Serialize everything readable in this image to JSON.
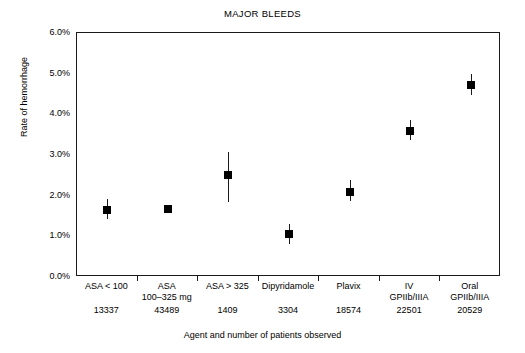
{
  "chart_data": {
    "type": "scatter",
    "title": "MAJOR BLEEDS",
    "xlabel": "Agent and number of patients observed",
    "ylabel": "Rate of hemorrhage",
    "ylim": [
      0.0,
      6.0
    ],
    "yticks": [
      "0.0%",
      "1.0%",
      "2.0%",
      "3.0%",
      "4.0%",
      "5.0%",
      "6.0%"
    ],
    "ytick_values": [
      0.0,
      1.0,
      2.0,
      3.0,
      4.0,
      5.0,
      6.0
    ],
    "grid": false,
    "legend": "none",
    "categories": [
      "ASA < 100",
      "ASA 100–325 mg",
      "ASA > 325",
      "Dipyridamole",
      "Plavix",
      "IV GPIIb/IIIA",
      "Oral GPIIb/IIIA"
    ],
    "category_lines": [
      [
        "ASA < 100"
      ],
      [
        "ASA",
        "100–325 mg"
      ],
      [
        "ASA > 325"
      ],
      [
        "Dipyridamole"
      ],
      [
        "Plavix"
      ],
      [
        "IV",
        "GPIIb/IIIA"
      ],
      [
        "Oral",
        "GPIIb/IIIA"
      ]
    ],
    "patient_counts": [
      "13337",
      "43489",
      "1409",
      "3304",
      "18574",
      "22501",
      "20529"
    ],
    "values": [
      1.65,
      1.68,
      2.5,
      1.05,
      2.1,
      3.6,
      4.73
    ],
    "error_low": [
      1.42,
      1.6,
      1.84,
      0.82,
      1.88,
      3.37,
      4.47
    ],
    "error_high": [
      1.92,
      1.78,
      3.07,
      1.3,
      2.38,
      3.85,
      5.0
    ],
    "marker_color": "#000000",
    "axis_color": "#1a1a1a",
    "background": "#ffffff"
  }
}
